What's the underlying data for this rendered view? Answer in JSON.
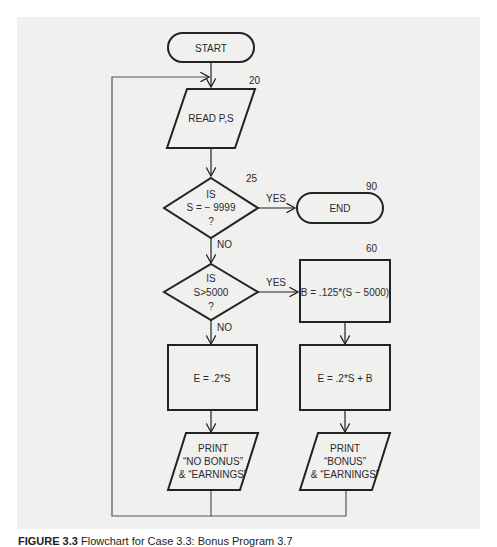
{
  "figure": {
    "caption_label": "FIGURE 3.3",
    "caption_text": "Flowchart for Case 3.3: Bonus Program 3.7"
  },
  "nodes": {
    "start": {
      "label": "START"
    },
    "read": {
      "label": "READ P,S",
      "line_number": "20"
    },
    "decision_sentinel": {
      "line1": "IS",
      "line2": "S = − 9999",
      "line3": "?",
      "line_number": "25"
    },
    "end": {
      "label": "END",
      "line_number": "90"
    },
    "decision_bonus": {
      "line1": "IS",
      "line2": "S>5000",
      "line3": "?"
    },
    "bonus_calc": {
      "label": "B = .125*(S − 5000)",
      "line_number": "60"
    },
    "earn_no_bonus": {
      "label": "E = .2*S"
    },
    "earn_with_bonus": {
      "label": "E = .2*S + B"
    },
    "print_no_bonus": {
      "line1": "PRINT",
      "line2": "“NO BONUS”",
      "line3": "& “EARNINGS”"
    },
    "print_bonus": {
      "line1": "PRINT",
      "line2": "“BONUS”",
      "line3": "& “EARNINGS”"
    }
  },
  "edges": {
    "sentinel_yes": "YES",
    "sentinel_no": "NO",
    "bonus_yes": "YES",
    "bonus_no": "NO"
  },
  "colors": {
    "paper": "#f0f0ef",
    "stroke": "#222222",
    "loop_line": "#555555"
  }
}
